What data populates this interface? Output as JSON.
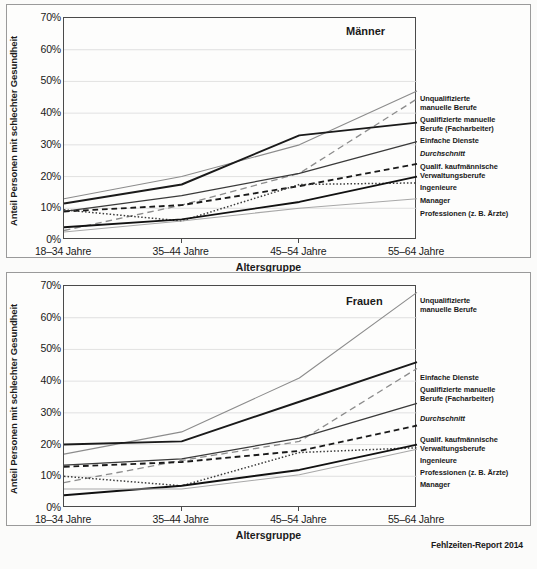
{
  "figure": {
    "footer": "Fehlzeiten-Report 2014",
    "y_axis_label": "Anteil Personen mit schlechter Gesundheit",
    "x_axis_label": "Altersgruppe",
    "y_ticks": [
      "0%",
      "10%",
      "20%",
      "30%",
      "40%",
      "50%",
      "60%",
      "70%"
    ],
    "x_ticks": [
      "18–34 Jahre",
      "35–44 Jahre",
      "45–54 Jahre",
      "55–64 Jahre"
    ]
  },
  "chart_data": [
    {
      "type": "line",
      "title": "Männer",
      "xlabel": "Altersgruppe",
      "ylabel": "Anteil Personen mit schlechter Gesundheit",
      "categories": [
        "18–34 Jahre",
        "35–44 Jahre",
        "45–54 Jahre",
        "55–64 Jahre"
      ],
      "ylim": [
        0,
        70
      ],
      "ytick_values": [
        0,
        10,
        20,
        30,
        40,
        50,
        60,
        70
      ],
      "grid": true,
      "legend_position": "right",
      "series": [
        {
          "name": "Unqualifizierte manuelle Berufe",
          "values": [
            13.0,
            20.0,
            30.0,
            47.0
          ],
          "style": "solid",
          "color": "#8c8c8c",
          "width": 1.1
        },
        {
          "name": "Qualifizierte manuelle Berufe (Facharbeiter)",
          "values": [
            3.0,
            11.0,
            21.0,
            44.5
          ],
          "style": "dashed-long",
          "color": "#8c8c8c",
          "width": 1.3
        },
        {
          "name": "Einfache Dienste",
          "values": [
            11.5,
            17.5,
            33.0,
            37.0
          ],
          "style": "solid",
          "color": "#1a1a1a",
          "width": 1.9
        },
        {
          "name": "Durchschnitt",
          "values": [
            9.0,
            14.0,
            21.0,
            31.0
          ],
          "style": "solid",
          "color": "#3a3a3a",
          "width": 1.3
        },
        {
          "name": "Qualif. kaufmännische Verwaltungsberufe",
          "values": [
            9.0,
            11.0,
            17.0,
            24.0
          ],
          "style": "dashed",
          "color": "#1a1a1a",
          "width": 1.9
        },
        {
          "name": "Ingenieure",
          "values": [
            9.5,
            6.0,
            17.5,
            18.0
          ],
          "style": "dotted",
          "color": "#3a3a3a",
          "width": 1.5
        },
        {
          "name": "Manager",
          "values": [
            4.0,
            6.5,
            12.0,
            20.0
          ],
          "style": "solid",
          "color": "#111111",
          "width": 1.9
        },
        {
          "name": "Professionen (z. B. Ärzte)",
          "values": [
            2.5,
            6.0,
            10.0,
            13.0
          ],
          "style": "solid",
          "color": "#a8a8a8",
          "width": 1.1
        }
      ],
      "legend_entries": [
        {
          "label_lines": [
            "Unqualifizierte",
            "manuelle Berufe"
          ],
          "italic": false,
          "top": 78
        },
        {
          "label_lines": [
            "Qualifizierte manuelle",
            "Berufe (Facharbeiter)"
          ],
          "italic": false,
          "top": 99
        },
        {
          "label_lines": [
            "Einfache Dienste"
          ],
          "italic": false,
          "top": 120
        },
        {
          "label_lines": [
            "Durchschnitt"
          ],
          "italic": true,
          "top": 133
        },
        {
          "label_lines": [
            "Qualif. kaufmännische",
            "Verwaltungsberufe"
          ],
          "italic": false,
          "top": 146
        },
        {
          "label_lines": [
            "Ingenieure"
          ],
          "italic": false,
          "top": 167
        },
        {
          "label_lines": [
            "Manager"
          ],
          "italic": false,
          "top": 180
        },
        {
          "label_lines": [
            "Professionen (z. B. Ärzte)"
          ],
          "italic": false,
          "top": 193
        }
      ]
    },
    {
      "type": "line",
      "title": "Frauen",
      "xlabel": "Altersgruppe",
      "ylabel": "Anteil Personen mit schlechter Gesundheit",
      "categories": [
        "18–34 Jahre",
        "35–44 Jahre",
        "45–54 Jahre",
        "55–64 Jahre"
      ],
      "ylim": [
        0,
        70
      ],
      "ytick_values": [
        0,
        10,
        20,
        30,
        40,
        50,
        60,
        70
      ],
      "grid": true,
      "legend_position": "right",
      "series": [
        {
          "name": "Unqualifizierte manuelle Berufe",
          "values": [
            17.0,
            24.0,
            41.0,
            68.0
          ],
          "style": "solid",
          "color": "#8c8c8c",
          "width": 1.1
        },
        {
          "name": "Einfache Dienste",
          "values": [
            20.0,
            21.0,
            33.5,
            46.0
          ],
          "style": "solid",
          "color": "#1a1a1a",
          "width": 1.9
        },
        {
          "name": "Qualifizierte manuelle Berufe (Facharbeiter)",
          "values": [
            8.0,
            15.0,
            21.0,
            44.0
          ],
          "style": "dashed-long",
          "color": "#8c8c8c",
          "width": 1.3
        },
        {
          "name": "Durchschnitt",
          "values": [
            13.5,
            15.5,
            22.0,
            33.0
          ],
          "style": "solid",
          "color": "#3a3a3a",
          "width": 1.3
        },
        {
          "name": "Qualif. kaufmännische Verwaltungsberufe",
          "values": [
            13.0,
            14.5,
            18.0,
            26.0
          ],
          "style": "dashed",
          "color": "#1a1a1a",
          "width": 1.9
        },
        {
          "name": "Ingenieure",
          "values": [
            10.0,
            7.0,
            17.5,
            19.0
          ],
          "style": "dotted",
          "color": "#3a3a3a",
          "width": 1.5
        },
        {
          "name": "Professionen (z. B. Ärzte)",
          "values": [
            4.0,
            7.0,
            12.0,
            20.0
          ],
          "style": "solid",
          "color": "#111111",
          "width": 1.9
        },
        {
          "name": "Manager",
          "values": [
            6.0,
            6.0,
            10.5,
            18.5
          ],
          "style": "solid",
          "color": "#a8a8a8",
          "width": 1.1
        }
      ],
      "legend_entries": [
        {
          "label_lines": [
            "Unqualifizierte",
            "manuelle Berufe"
          ],
          "italic": false,
          "top": 12
        },
        {
          "label_lines": [
            "Einfache Dienste"
          ],
          "italic": false,
          "top": 89
        },
        {
          "label_lines": [
            "Qualifizierte manuelle",
            "Berufe (Facharbeiter)"
          ],
          "italic": false,
          "top": 101
        },
        {
          "label_lines": [
            "Durchschnitt"
          ],
          "italic": true,
          "top": 130
        },
        {
          "label_lines": [
            "Qualif. kaufmännische",
            "Verwaltungsberufe"
          ],
          "italic": false,
          "top": 151
        },
        {
          "label_lines": [
            "Ingenieure"
          ],
          "italic": false,
          "top": 172
        },
        {
          "label_lines": [
            "Professionen (z. B. Ärzte)"
          ],
          "italic": false,
          "top": 184
        },
        {
          "label_lines": [
            "Manager"
          ],
          "italic": false,
          "top": 196
        }
      ]
    }
  ]
}
